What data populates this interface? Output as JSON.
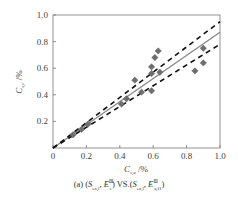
{
  "chart_data": {
    "type": "scatter",
    "title": "",
    "caption": "(a) (S_{ea,l}, E_e^Ⅲ) VS.(S_{ea,l}, E_{a,l1}^Ⅲ)",
    "xlabel": "C_{s,a} /%",
    "ylabel": "C_{s,e} /%",
    "xlim": [
      0,
      1.0
    ],
    "ylim": [
      0,
      1.0
    ],
    "x_ticks": [
      "0",
      "0.2",
      "0.4",
      "0.6",
      "0.8",
      "1.0"
    ],
    "y_ticks": [
      "0.2",
      "0.4",
      "0.6",
      "0.8",
      "1.0"
    ],
    "grid": false,
    "legend": null,
    "series": [
      {
        "name": "data",
        "marker": "diamond",
        "color": "#6e6e6e",
        "points": [
          [
            0.12,
            0.1
          ],
          [
            0.17,
            0.14
          ],
          [
            0.21,
            0.18
          ],
          [
            0.41,
            0.33
          ],
          [
            0.44,
            0.37
          ],
          [
            0.49,
            0.51
          ],
          [
            0.53,
            0.42
          ],
          [
            0.59,
            0.43
          ],
          [
            0.59,
            0.56
          ],
          [
            0.59,
            0.61
          ],
          [
            0.61,
            0.68
          ],
          [
            0.63,
            0.73
          ],
          [
            0.64,
            0.57
          ],
          [
            0.85,
            0.58
          ],
          [
            0.9,
            0.64
          ],
          [
            0.9,
            0.75
          ]
        ]
      }
    ],
    "lines": [
      {
        "name": "fit",
        "style": "solid",
        "color": "#8a8a8a",
        "from": [
          0,
          0
        ],
        "to": [
          1.0,
          0.87
        ]
      },
      {
        "name": "upper-bound",
        "style": "dashed",
        "color": "#111111",
        "from": [
          0,
          0
        ],
        "to": [
          1.0,
          0.95
        ]
      },
      {
        "name": "lower-bound",
        "style": "dashed",
        "color": "#111111",
        "from": [
          0,
          0
        ],
        "to": [
          1.0,
          0.78
        ]
      }
    ]
  },
  "labels": {
    "xlabel_main": "C",
    "xlabel_sub": "s,a",
    "xlabel_unit": " /%",
    "ylabel_main": "C",
    "ylabel_sub": "s,e",
    "ylabel_unit": " /%",
    "caption_prefix": "(a) (",
    "caption_s1": "S",
    "caption_s1_sub": "ea,l",
    "caption_e1": ", E",
    "caption_e1_sup": "Ⅲ",
    "caption_e1_sub": "e",
    "caption_mid": ") VS.(",
    "caption_s2": "S",
    "caption_s2_sub": "ea,l",
    "caption_e2": ", E",
    "caption_e2_sup": "Ⅲ",
    "caption_e2_sub": "a,l1",
    "caption_end": ")"
  }
}
